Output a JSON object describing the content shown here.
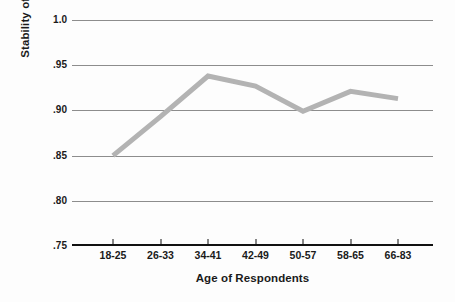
{
  "chart_data": {
    "type": "line",
    "title": "",
    "xlabel": "Age of Respondents",
    "ylabel": "Stability of Attitudes",
    "categories": [
      "18-25",
      "26-33",
      "34-41",
      "42-49",
      "50-57",
      "58-65",
      "66-83"
    ],
    "values": [
      0.85,
      0.893,
      0.938,
      0.927,
      0.899,
      0.921,
      0.913
    ],
    "series": [
      {
        "name": "Stability of Attitudes",
        "values": [
          0.85,
          0.893,
          0.938,
          0.927,
          0.899,
          0.921,
          0.913
        ]
      }
    ],
    "ylim": [
      0.75,
      1.0
    ],
    "ytick_labels": [
      "1.0",
      ".95",
      ".90",
      ".85",
      ".80",
      ".75"
    ],
    "ytick_values": [
      1.0,
      0.95,
      0.9,
      0.85,
      0.8,
      0.75
    ],
    "grid": true,
    "legend": "none",
    "line_color": "#b3b3b3",
    "line_width": 5,
    "grid_color": "#8d8d8d",
    "axis_color": "#111111",
    "background_color": "#fdfdfd"
  }
}
